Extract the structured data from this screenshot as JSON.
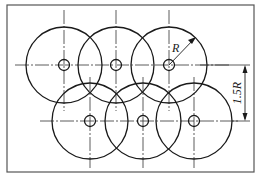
{
  "figure": {
    "type": "hole-pattern-drawing",
    "frame": {
      "x": 7,
      "y": 5,
      "width": 247,
      "height": 167
    },
    "large_circle_radius": 38,
    "hole_radius": 5.5,
    "rows": [
      {
        "name": "top",
        "y": 65,
        "centers_x": [
          64,
          116,
          169
        ]
      },
      {
        "name": "bottom",
        "y": 121,
        "centers_x": [
          90,
          143,
          194
        ]
      }
    ],
    "labels": {
      "radius": "R",
      "row_spacing": "1.5R"
    },
    "colors": {
      "line": "#1a1a1a",
      "frame": "#555555",
      "background": "#ffffff"
    }
  }
}
